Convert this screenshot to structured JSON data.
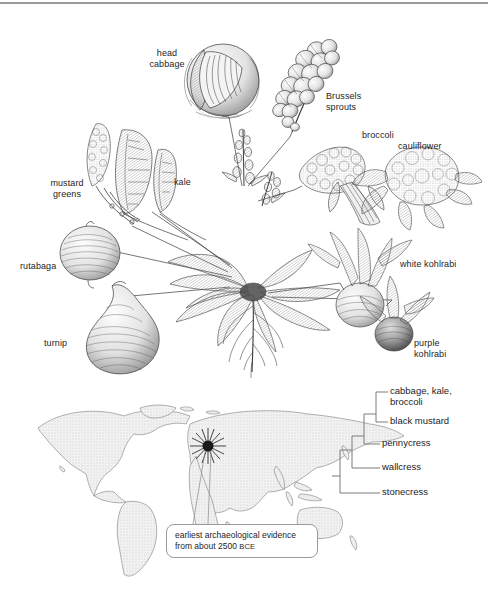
{
  "figure": {
    "title_present": false,
    "line_color": "#3a3a3a",
    "text_color": "#1d1d1d",
    "map_fill": "#e9e9e9",
    "map_stroke": "#7d7d7d",
    "rule_color": "#9a9a9a"
  },
  "cultivar_labels": [
    {
      "id": "head-cabbage",
      "text": "head\ncabbage",
      "x": 143,
      "y": 48,
      "w": 48,
      "align": "center"
    },
    {
      "id": "brussels-sprouts",
      "text": "Brussels\nsprouts",
      "x": 326,
      "y": 91,
      "w": 54,
      "align": "left"
    },
    {
      "id": "broccoli",
      "text": "broccoli",
      "x": 362,
      "y": 130,
      "w": 44,
      "align": "left"
    },
    {
      "id": "cauliflower",
      "text": "cauliflower",
      "x": 398,
      "y": 141,
      "w": 56,
      "align": "left"
    },
    {
      "id": "kale",
      "text": "kale",
      "x": 174,
      "y": 177,
      "w": 28,
      "align": "left"
    },
    {
      "id": "mustard-greens",
      "text": "mustard\ngreens",
      "x": 40,
      "y": 178,
      "w": 52,
      "align": "center"
    },
    {
      "id": "rutabaga",
      "text": "rutabaga",
      "x": 20,
      "y": 261,
      "w": 44,
      "align": "left"
    },
    {
      "id": "turnip",
      "text": "turnip",
      "x": 44,
      "y": 338,
      "w": 34,
      "align": "left"
    },
    {
      "id": "white-kohlrabi",
      "text": "white kohlrabi",
      "x": 400,
      "y": 259,
      "w": 74,
      "align": "left"
    },
    {
      "id": "purple-kohlrabi",
      "text": "purple\nkohlrabi",
      "x": 414,
      "y": 338,
      "w": 54,
      "align": "left"
    }
  ],
  "cladogram": {
    "taxa": [
      {
        "id": "cabbage-kale-broccoli",
        "label": "cabbage, kale,\nbroccoli",
        "tip_y": 9,
        "label_x": 52,
        "label_y": 2
      },
      {
        "id": "black-mustard",
        "label": "black mustard",
        "tip_y": 39,
        "label_x": 52,
        "label_y": 32
      },
      {
        "id": "pennycress",
        "label": "pennycress",
        "tip_y": 61,
        "label_x": 52,
        "label_y": 54
      },
      {
        "id": "wallcress",
        "label": "wallcress",
        "tip_y": 85,
        "label_x": 52,
        "label_y": 78
      },
      {
        "id": "stonecress",
        "label": "stonecress",
        "tip_y": 110,
        "label_x": 52,
        "label_y": 103
      }
    ]
  },
  "map": {
    "marker": {
      "id": "origin-starburst",
      "x": 208,
      "y": 446,
      "label": "origin of domestication"
    },
    "callout": {
      "line1": "earliest archaeological evidence",
      "line2_prefix": "from about 2500 ",
      "line2_era": "BCE"
    }
  }
}
